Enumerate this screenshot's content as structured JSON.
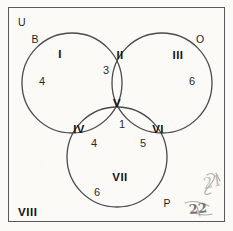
{
  "diagram": {
    "type": "venn-3-set",
    "universe_label": "U",
    "set_labels": {
      "left": "B",
      "right": "O",
      "bottom": "P"
    },
    "regions": [
      {
        "id": "I",
        "roman": "I",
        "count": "4",
        "meaning": "B only"
      },
      {
        "id": "II",
        "roman": "II",
        "count": "3",
        "meaning": "B and O only"
      },
      {
        "id": "III",
        "roman": "III",
        "count": "6",
        "meaning": "O only"
      },
      {
        "id": "IV",
        "roman": "IV",
        "count": "4",
        "meaning": "B and P only"
      },
      {
        "id": "V",
        "roman": "V",
        "count": "1",
        "meaning": "B and O and P"
      },
      {
        "id": "VI",
        "roman": "VI",
        "count": "5",
        "meaning": "O and P only"
      },
      {
        "id": "VII",
        "roman": "VII",
        "count": "6",
        "meaning": "P only"
      },
      {
        "id": "VIII",
        "roman": "VIII",
        "count": "",
        "meaning": "outside all sets"
      }
    ],
    "annotations": [
      {
        "id": "pencil-upper",
        "text": "21"
      },
      {
        "id": "pencil-lower",
        "text": "22"
      }
    ],
    "colors": {
      "stroke": "#4a4a4c",
      "rect_stroke": "#58585a",
      "text": "#141414",
      "background": "#fbfaf7",
      "pencil": "#6f6c68"
    }
  }
}
